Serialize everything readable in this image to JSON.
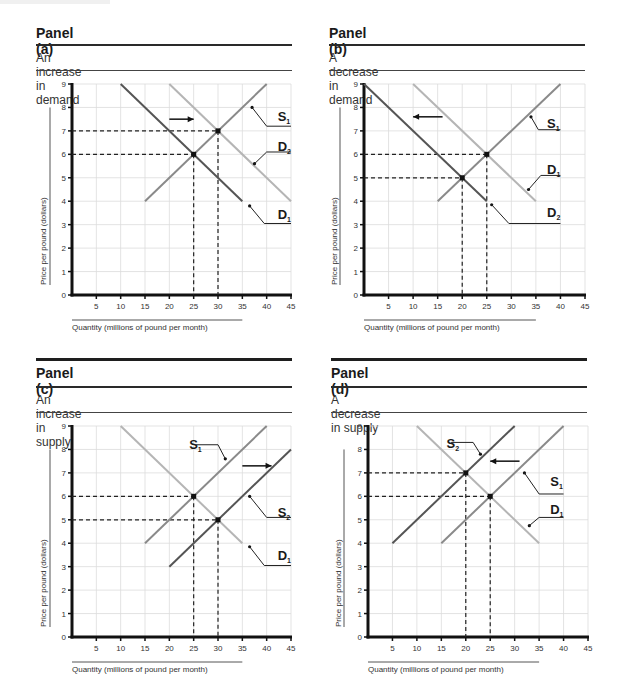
{
  "chart_data": [
    {
      "id": "a",
      "type": "line",
      "title": "Panel (a)",
      "subtitle": "An increase in demand",
      "xlabel": "Quantity (millions of pound per month)",
      "ylabel": "Price per pound (dollars)",
      "xlim": [
        0,
        45
      ],
      "ylim": [
        0,
        9
      ],
      "xticks": [
        5,
        10,
        15,
        20,
        25,
        30,
        35,
        40,
        45
      ],
      "yticks": [
        0,
        1,
        2,
        3,
        4,
        5,
        6,
        7,
        8,
        9
      ],
      "grid": true,
      "series": [
        {
          "name": "S1",
          "label": "S",
          "sub": "1",
          "color": "#8a8a8a",
          "points": [
            [
              15,
              4
            ],
            [
              40,
              9
            ]
          ]
        },
        {
          "name": "D1",
          "label": "D",
          "sub": "1",
          "color": "#555555",
          "points": [
            [
              10,
              9
            ],
            [
              35,
              4
            ]
          ]
        },
        {
          "name": "D2",
          "label": "D",
          "sub": "2",
          "color": "#b5b5b5",
          "points": [
            [
              20,
              9
            ],
            [
              45,
              4
            ]
          ]
        }
      ],
      "equilibria": [
        {
          "x": 25,
          "y": 6,
          "label": "initial"
        },
        {
          "x": 30,
          "y": 7,
          "label": "new"
        }
      ],
      "arrow": {
        "from": [
          20,
          7.5
        ],
        "to": [
          25,
          7.5
        ],
        "direction": "right"
      },
      "labels": [
        {
          "text": "S",
          "sub": "1",
          "x": 43.5,
          "y": 7.6,
          "leader_from": [
            37,
            8
          ],
          "leader_to": [
            40,
            7.2
          ],
          "leader_end": [
            45,
            7.2
          ]
        },
        {
          "text": "D",
          "sub": "2",
          "x": 43.5,
          "y": 6.3,
          "leader_from": [
            37.5,
            5.6
          ],
          "leader_to": [
            40,
            6.1
          ],
          "leader_end": [
            45,
            6.1
          ]
        },
        {
          "text": "D",
          "sub": "1",
          "x": 43.5,
          "y": 3.4,
          "leader_from": [
            36.5,
            3.8
          ],
          "leader_to": [
            39.5,
            3.05
          ],
          "leader_end": [
            45,
            3.05
          ]
        }
      ]
    },
    {
      "id": "b",
      "type": "line",
      "title": "Panel (b)",
      "subtitle": "A decrease in demand",
      "xlabel": "Quantity (millions of pound per month)",
      "ylabel": "Price per pound (dollars)",
      "xlim": [
        0,
        45
      ],
      "ylim": [
        0,
        9
      ],
      "xticks": [
        5,
        10,
        15,
        20,
        25,
        30,
        35,
        40,
        45
      ],
      "yticks": [
        0,
        1,
        2,
        3,
        4,
        5,
        6,
        7,
        8,
        9
      ],
      "grid": true,
      "series": [
        {
          "name": "S1",
          "label": "S",
          "sub": "1",
          "color": "#8a8a8a",
          "points": [
            [
              15,
              4
            ],
            [
              40,
              9
            ]
          ]
        },
        {
          "name": "D1",
          "label": "D",
          "sub": "1",
          "color": "#b5b5b5",
          "points": [
            [
              10,
              9
            ],
            [
              35,
              4
            ]
          ]
        },
        {
          "name": "D2",
          "label": "D",
          "sub": "2",
          "color": "#555555",
          "points": [
            [
              0,
              9
            ],
            [
              25,
              4
            ]
          ]
        }
      ],
      "equilibria": [
        {
          "x": 25,
          "y": 6,
          "label": "initial"
        },
        {
          "x": 20,
          "y": 5,
          "label": "new"
        }
      ],
      "arrow": {
        "from": [
          16,
          7.6
        ],
        "to": [
          10,
          7.6
        ],
        "direction": "left"
      },
      "labels": [
        {
          "text": "S",
          "sub": "1",
          "x": 38.5,
          "y": 7.3,
          "leader_from": [
            34,
            7.6
          ],
          "leader_to": [
            35.5,
            7.05
          ],
          "leader_end": [
            40,
            7.05
          ]
        },
        {
          "text": "D",
          "sub": "1",
          "x": 38.5,
          "y": 5.35,
          "leader_from": [
            33.5,
            4.5
          ],
          "leader_to": [
            36,
            5.1
          ],
          "leader_end": [
            40,
            5.1
          ]
        },
        {
          "text": "D",
          "sub": "2",
          "x": 38.5,
          "y": 3.5,
          "leader_from": [
            26,
            3.85
          ],
          "leader_to": [
            29.5,
            3.05
          ],
          "leader_end": [
            40,
            3.05
          ]
        }
      ]
    },
    {
      "id": "c",
      "type": "line",
      "title": "Panel (c)",
      "subtitle": "An increase in supply",
      "xlabel": "Quantity (millions of pound per month)",
      "ylabel": "Price per pound (dollars)",
      "xlim": [
        0,
        45
      ],
      "ylim": [
        0,
        9
      ],
      "xticks": [
        5,
        10,
        15,
        20,
        25,
        30,
        35,
        40,
        45
      ],
      "yticks": [
        0,
        1,
        2,
        3,
        4,
        5,
        6,
        7,
        8,
        9
      ],
      "grid": true,
      "series": [
        {
          "name": "S1",
          "label": "S",
          "sub": "1",
          "color": "#8a8a8a",
          "points": [
            [
              15,
              4
            ],
            [
              40,
              9
            ]
          ]
        },
        {
          "name": "S2",
          "label": "S",
          "sub": "2",
          "color": "#555555",
          "points": [
            [
              20,
              3
            ],
            [
              45,
              8
            ]
          ]
        },
        {
          "name": "D1",
          "label": "D",
          "sub": "1",
          "color": "#b5b5b5",
          "points": [
            [
              10,
              9
            ],
            [
              35,
              4
            ]
          ]
        }
      ],
      "equilibria": [
        {
          "x": 25,
          "y": 6,
          "label": "initial"
        },
        {
          "x": 30,
          "y": 5,
          "label": "new"
        }
      ],
      "arrow": {
        "from": [
          35,
          7.3
        ],
        "to": [
          41,
          7.3
        ],
        "direction": "right"
      },
      "labels": [
        {
          "text": "S",
          "sub": "1",
          "x": 25.3,
          "y": 8.2,
          "leader_from": [
            31.5,
            7.6
          ],
          "leader_to": [
            30,
            8.2
          ],
          "leader_end": [
            25.5,
            8.2
          ]
        },
        {
          "text": "S",
          "sub": "2",
          "x": 43.5,
          "y": 5.3,
          "leader_from": [
            36.5,
            6
          ],
          "leader_to": [
            40,
            5.1
          ],
          "leader_end": [
            45,
            5.1
          ]
        },
        {
          "text": "D",
          "sub": "1",
          "x": 43.5,
          "y": 3.45,
          "leader_from": [
            36.5,
            3.85
          ],
          "leader_to": [
            39.5,
            3.05
          ],
          "leader_end": [
            45,
            3.05
          ]
        }
      ]
    },
    {
      "id": "d",
      "type": "line",
      "title": "Panel (d)",
      "subtitle": "A decrease in supply",
      "xlabel": "Quantity (millions of pound per month)",
      "ylabel": "Price per pound (dollars)",
      "xlim": [
        0,
        45
      ],
      "ylim": [
        0,
        9
      ],
      "xticks": [
        5,
        10,
        15,
        20,
        25,
        30,
        35,
        40,
        45
      ],
      "yticks": [
        0,
        1,
        2,
        3,
        4,
        5,
        6,
        7,
        8,
        9
      ],
      "grid": true,
      "series": [
        {
          "name": "S1",
          "label": "S",
          "sub": "1",
          "color": "#8a8a8a",
          "points": [
            [
              15,
              4
            ],
            [
              40,
              9
            ]
          ]
        },
        {
          "name": "S2",
          "label": "S",
          "sub": "2",
          "color": "#555555",
          "points": [
            [
              5,
              4
            ],
            [
              30,
              9
            ]
          ]
        },
        {
          "name": "D1",
          "label": "D",
          "sub": "1",
          "color": "#b5b5b5",
          "points": [
            [
              10,
              9
            ],
            [
              35,
              4
            ]
          ]
        }
      ],
      "equilibria": [
        {
          "x": 25,
          "y": 6,
          "label": "initial"
        },
        {
          "x": 20,
          "y": 7,
          "label": "new"
        }
      ],
      "arrow": {
        "from": [
          31,
          7.5
        ],
        "to": [
          25,
          7.5
        ],
        "direction": "left"
      },
      "labels": [
        {
          "text": "S",
          "sub": "2",
          "x": 17.3,
          "y": 8.25,
          "leader_from": [
            23,
            7.8
          ],
          "leader_to": [
            21.5,
            8.3
          ],
          "leader_end": [
            17,
            8.3
          ]
        },
        {
          "text": "S",
          "sub": "1",
          "x": 38.5,
          "y": 6.6,
          "leader_from": [
            32,
            7
          ],
          "leader_to": [
            35,
            6.1
          ],
          "leader_end": [
            40,
            6.1
          ]
        },
        {
          "text": "D",
          "sub": "1",
          "x": 38.5,
          "y": 5.4,
          "leader_from": [
            33,
            4.75
          ],
          "leader_to": [
            35,
            5.1
          ],
          "leader_end": [
            40,
            5.1
          ]
        }
      ]
    }
  ]
}
